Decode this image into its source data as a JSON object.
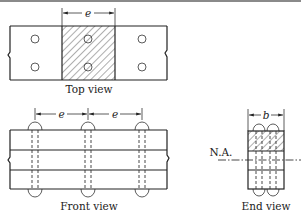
{
  "figure": {
    "top_view": {
      "label": "Top view",
      "dimension_label": "e",
      "hole_rows": 2,
      "hole_columns": 3
    },
    "front_view": {
      "label": "Front view",
      "dimension_labels": [
        "e",
        "e"
      ],
      "layers": 3,
      "bolts": 3
    },
    "end_view": {
      "label": "End view",
      "dimension_label": "b",
      "neutral_axis_label": "N.A.",
      "bolts": 2
    }
  },
  "colors": {
    "line": "#222222",
    "background": "#ffffff"
  }
}
